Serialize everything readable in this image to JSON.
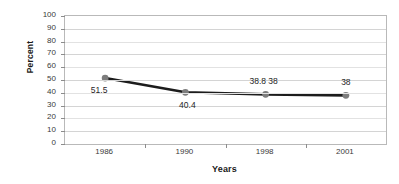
{
  "chart_data": {
    "type": "line",
    "title": "",
    "xlabel": "Years",
    "ylabel": "Percent",
    "categories": [
      "1986",
      "1990",
      "1998",
      "2001"
    ],
    "values": [
      51.5,
      40.4,
      38.8,
      38
    ],
    "point_labels": [
      "51.5",
      "40.4",
      "38.8 38",
      "38"
    ],
    "series": [
      {
        "name": "Percent",
        "values": [
          51.5,
          40.4,
          38.8,
          38
        ]
      }
    ],
    "ylim": [
      0,
      100
    ],
    "y_ticks": [
      0,
      10,
      20,
      30,
      40,
      50,
      60,
      70,
      80,
      90,
      100
    ],
    "y_tick_labels": [
      "0",
      "10",
      "20",
      "30",
      "40",
      "50",
      "60",
      "70",
      "80",
      "90",
      "100"
    ],
    "grid": true,
    "legend": "none",
    "colors": {
      "line": "#1c1c1c",
      "marker": "#7d7d7d",
      "gridline": "#d4d4d4",
      "axis": "#b9b9b9",
      "text": "#2b2b2b",
      "background": "#ffffff"
    }
  }
}
